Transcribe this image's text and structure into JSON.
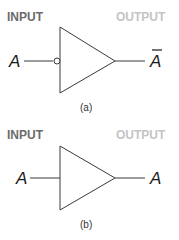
{
  "figures": [
    {
      "id": "a",
      "type": "inverter",
      "input_label": "INPUT",
      "output_label": "OUTPUT",
      "input_variable": "A",
      "output_variable": "A",
      "output_overbar": true,
      "caption": "(a)"
    },
    {
      "id": "b",
      "type": "buffer",
      "input_label": "INPUT",
      "output_label": "OUTPUT",
      "input_variable": "A",
      "output_variable": "A",
      "output_overbar": false,
      "caption": "(b)"
    }
  ],
  "colors": {
    "input_label": "#6b6b6b",
    "output_label": "#c4c4c4",
    "line": "#3a3a3a"
  }
}
